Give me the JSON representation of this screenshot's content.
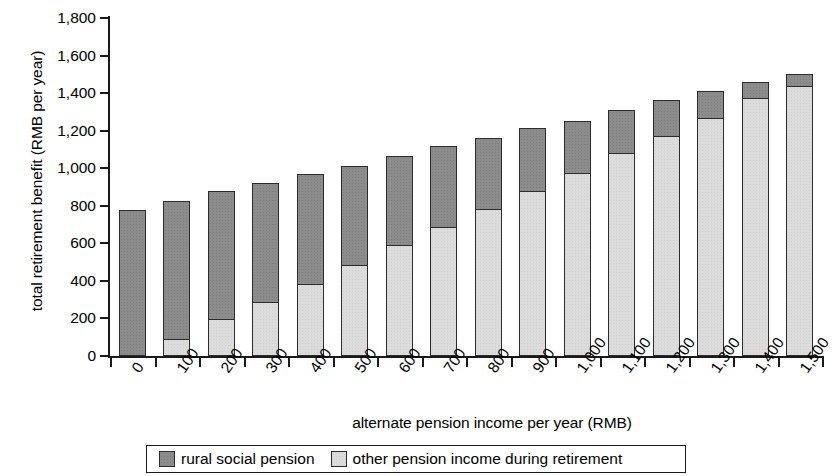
{
  "chart_data": {
    "type": "bar",
    "stacked": true,
    "title": "",
    "xlabel": "alternate pension income per year (RMB)",
    "ylabel": "total retirement benefit (RMB per year)",
    "categories": [
      "0",
      "100",
      "200",
      "300",
      "400",
      "500",
      "600",
      "700",
      "800",
      "900",
      "1,000",
      "1,100",
      "1,200",
      "1,300",
      "1,400",
      "1,500"
    ],
    "series": [
      {
        "name": "other pension income during retirement",
        "color": "#dcdcdc",
        "values": [
          0,
          90,
          195,
          290,
          385,
          485,
          590,
          685,
          785,
          880,
          975,
          1080,
          1170,
          1270,
          1375,
          1440
        ]
      },
      {
        "name": "rural social pension",
        "color": "#8c8c8c",
        "values": [
          780,
          745,
          690,
          640,
          590,
          535,
          480,
          440,
          385,
          340,
          285,
          235,
          200,
          150,
          90,
          70
        ]
      }
    ],
    "totals": [
      780,
      835,
      885,
      930,
      975,
      1020,
      1070,
      1125,
      1170,
      1220,
      1260,
      1315,
      1370,
      1420,
      1465,
      1510
    ],
    "ylim": [
      0,
      1800
    ],
    "yticks": [
      "0",
      "200",
      "400",
      "600",
      "800",
      "1,000",
      "1,200",
      "1,400",
      "1,600",
      "1,800"
    ],
    "ytick_values": [
      0,
      200,
      400,
      600,
      800,
      1000,
      1200,
      1400,
      1600,
      1800
    ],
    "grid": false,
    "legend_position": "bottom",
    "legend": [
      {
        "label": "rural social pension",
        "swatch": "dark"
      },
      {
        "label": "other pension income during retirement",
        "swatch": "light"
      }
    ]
  }
}
